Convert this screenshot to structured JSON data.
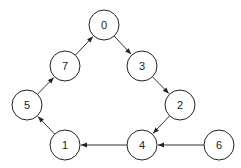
{
  "diagram": {
    "type": "directed-graph",
    "nodes": [
      {
        "id": "0",
        "label": "0",
        "x": 104,
        "y": 25
      },
      {
        "id": "7",
        "label": "7",
        "x": 65,
        "y": 66
      },
      {
        "id": "3",
        "label": "3",
        "x": 142,
        "y": 66
      },
      {
        "id": "5",
        "label": "5",
        "x": 27,
        "y": 105
      },
      {
        "id": "2",
        "label": "2",
        "x": 180,
        "y": 105
      },
      {
        "id": "1",
        "label": "1",
        "x": 65,
        "y": 145
      },
      {
        "id": "4",
        "label": "4",
        "x": 142,
        "y": 145
      },
      {
        "id": "6",
        "label": "6",
        "x": 219,
        "y": 145
      }
    ],
    "edges": [
      {
        "from": "0",
        "to": "3"
      },
      {
        "from": "3",
        "to": "2"
      },
      {
        "from": "2",
        "to": "4"
      },
      {
        "from": "6",
        "to": "4"
      },
      {
        "from": "4",
        "to": "1"
      },
      {
        "from": "1",
        "to": "5"
      },
      {
        "from": "5",
        "to": "7"
      },
      {
        "from": "7",
        "to": "0"
      }
    ]
  }
}
